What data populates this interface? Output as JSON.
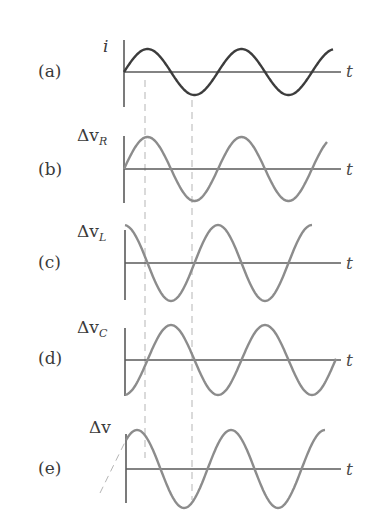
{
  "figure": {
    "panels": [
      {
        "id": "a",
        "label": "(a)",
        "ylabel": "i",
        "ylabel_sub": "",
        "xlabel": "t",
        "curve_color": "#3c3c3c"
      },
      {
        "id": "b",
        "label": "(b)",
        "ylabel": "Δv",
        "ylabel_sub": "R",
        "xlabel": "t",
        "curve_color": "#8c8c8c"
      },
      {
        "id": "c",
        "label": "(c)",
        "ylabel": "Δv",
        "ylabel_sub": "L",
        "xlabel": "t",
        "curve_color": "#8c8c8c"
      },
      {
        "id": "d",
        "label": "(d)",
        "ylabel": "Δv",
        "ylabel_sub": "C",
        "xlabel": "t",
        "curve_color": "#8c8c8c"
      },
      {
        "id": "e",
        "label": "(e)",
        "ylabel": "Δv",
        "ylabel_sub": "",
        "xlabel": "t",
        "curve_color": "#8c8c8c"
      }
    ]
  },
  "chart_data": {
    "type": "line",
    "title": "",
    "xlabel": "t",
    "grid": false,
    "series": [
      {
        "name": "i",
        "panel": "(a)",
        "function": "sin(ωt)",
        "phase_deg": 0,
        "relative_amplitude": 0.6
      },
      {
        "name": "Δv_R",
        "panel": "(b)",
        "function": "sin(ωt)",
        "phase_deg": 0,
        "relative_amplitude": 0.82
      },
      {
        "name": "Δv_L",
        "panel": "(c)",
        "function": "sin(ωt + 90°)",
        "phase_deg": 90,
        "relative_amplitude": 0.95
      },
      {
        "name": "Δv_C",
        "panel": "(d)",
        "function": "sin(ωt − 90°)",
        "phase_deg": -90,
        "relative_amplitude": 0.9
      },
      {
        "name": "Δv",
        "panel": "(e)",
        "function": "sin(ωt + φ)",
        "phase_deg": 40,
        "relative_amplitude": 1.0
      }
    ],
    "cycles_shown": 2.25,
    "reference_lines": [
      "dashed vertical at peak of i (t = T/4)",
      "dashed vertical at trough of i (t = 3T/4)"
    ],
    "annotations": [
      "dashed extrapolation of Δv curve before t = 0 in panel (e)"
    ]
  }
}
